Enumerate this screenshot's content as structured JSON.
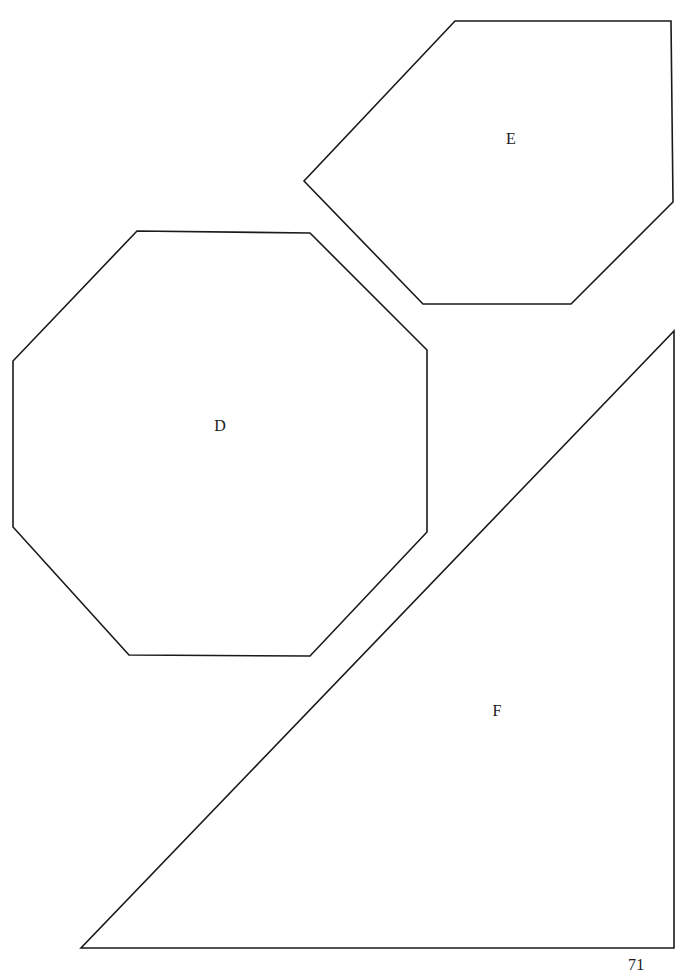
{
  "page": {
    "number": "71",
    "background_color": "#ffffff",
    "ink_color": "#1a1a1a",
    "width": 688,
    "height": 980
  },
  "figures": [
    {
      "id": "shape-d",
      "label": "D",
      "kind": "octagon",
      "sides": 8,
      "label_x": 220,
      "label_y": 427,
      "points": "137,231 310,233 427,350 427,532 310,656 129,655 13,527 13,361"
    },
    {
      "id": "shape-e",
      "label": "E",
      "kind": "hexagon",
      "sides": 6,
      "label_x": 511,
      "label_y": 140,
      "points": "455,21 671,21 673,202 571,304 423,304 304,181"
    },
    {
      "id": "shape-f",
      "label": "F",
      "kind": "right-triangle",
      "sides": 3,
      "label_x": 497,
      "label_y": 712,
      "points": "674,331 674,948 81,948"
    }
  ]
}
